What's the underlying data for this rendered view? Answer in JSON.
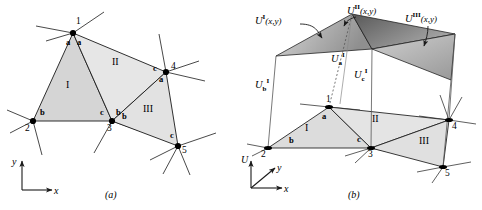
{
  "figure": {
    "panels": [
      {
        "id": "a",
        "caption": "(a)",
        "description": "Planar triangular mesh with global node numbers and local element node labels"
      },
      {
        "id": "b",
        "caption": "(b)",
        "description": "Lifted surface U(x,y) built from element-wise linear trial functions"
      }
    ]
  },
  "panel_a": {
    "caption": "(a)",
    "axes": {
      "x_label": "x",
      "y_label": "y"
    },
    "nodes": [
      {
        "id": "1",
        "label": "1",
        "x": 73,
        "y": 33
      },
      {
        "id": "2",
        "label": "2",
        "x": 33,
        "y": 121
      },
      {
        "id": "3",
        "label": "3",
        "x": 112,
        "y": 121
      },
      {
        "id": "4",
        "label": "4",
        "x": 166,
        "y": 72
      },
      {
        "id": "5",
        "label": "5",
        "x": 178,
        "y": 146
      }
    ],
    "elements": [
      {
        "label": "I",
        "nodes": [
          "1",
          "2",
          "3"
        ],
        "centroid_x": 72,
        "centroid_y": 90,
        "local_labels": [
          {
            "text": "a",
            "x": 70,
            "y": 43
          },
          {
            "text": "b",
            "x": 42,
            "y": 113
          },
          {
            "text": "c",
            "x": 102,
            "y": 113
          }
        ]
      },
      {
        "label": "II",
        "nodes": [
          "1",
          "3",
          "4"
        ],
        "centroid_x": 118,
        "centroid_y": 72,
        "local_labels": [
          {
            "text": "a",
            "x": 80,
            "y": 43
          },
          {
            "text": "b",
            "x": 117,
            "y": 112
          },
          {
            "text": "c",
            "x": 155,
            "y": 72
          }
        ]
      },
      {
        "label": "III",
        "nodes": [
          "4",
          "3",
          "5"
        ],
        "centroid_x": 152,
        "centroid_y": 113,
        "local_labels": [
          {
            "text": "a",
            "x": 161,
            "y": 82
          },
          {
            "text": "b",
            "x": 123,
            "y": 119
          },
          {
            "text": "c",
            "x": 172,
            "y": 138
          }
        ]
      }
    ],
    "element_labels": [
      {
        "text": "I",
        "x": 69,
        "y": 85
      },
      {
        "text": "II",
        "x": 116,
        "y": 63
      },
      {
        "text": "III",
        "x": 148,
        "y": 110
      }
    ]
  },
  "panel_b": {
    "caption": "(b)",
    "axes": {
      "x_label": "x",
      "y_label": "y",
      "u_label": "U"
    },
    "surface_functions": [
      {
        "id": "U_I",
        "base": "U",
        "super": "I",
        "args": "(x,y)",
        "label_x": 263,
        "label_y": 20
      },
      {
        "id": "U_II",
        "base": "U",
        "super": "II",
        "args": "(x,y)",
        "label_x": 355,
        "label_y": 9
      },
      {
        "id": "U_III",
        "base": "U",
        "super": "III",
        "args": "(x,y)",
        "label_x": 412,
        "label_y": 17
      }
    ],
    "nodal_values": [
      {
        "id": "U_a_I",
        "base": "U",
        "sub": "a",
        "super": "I",
        "label_x": 335,
        "label_y": 57
      },
      {
        "id": "U_c_I",
        "base": "U",
        "sub": "c",
        "super": "I",
        "label_x": 358,
        "label_y": 73
      },
      {
        "id": "U_b_I",
        "base": "U",
        "sub": "b",
        "super": "I",
        "label_x": 259,
        "label_y": 83
      }
    ],
    "nodes": [
      {
        "id": "1",
        "label": "1",
        "x": 329,
        "y": 107
      },
      {
        "id": "2",
        "label": "2",
        "x": 268,
        "y": 148
      },
      {
        "id": "3",
        "label": "3",
        "x": 371,
        "y": 148
      },
      {
        "id": "4",
        "label": "4",
        "x": 449,
        "y": 120
      },
      {
        "id": "5",
        "label": "5",
        "x": 443,
        "y": 167
      }
    ],
    "element_labels": [
      {
        "text": "I",
        "x": 308,
        "y": 129
      },
      {
        "text": "II",
        "x": 376,
        "y": 120
      },
      {
        "text": "III",
        "x": 425,
        "y": 142
      }
    ],
    "local_labels": [
      {
        "text": "a",
        "x": 325,
        "y": 117
      },
      {
        "text": "b",
        "x": 292,
        "y": 141
      },
      {
        "text": "c",
        "x": 360,
        "y": 140
      }
    ]
  },
  "colors": {
    "stroke": "#1a1a1a",
    "element_fill_light": "#e8e8e8",
    "element_fill_mid": "#dcdcdc",
    "surface_dark": "#6f6f6f",
    "surface_mid": "#b4b4b4",
    "surface_light": "#e0e0e0",
    "background": "#ffffff"
  }
}
